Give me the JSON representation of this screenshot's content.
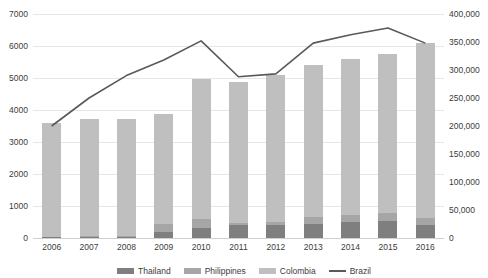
{
  "chart_data": {
    "type": "bar",
    "title": "",
    "subtitle": "",
    "xlabel": "",
    "ylabel": "",
    "grid": true,
    "legend_position": "bottom",
    "categories": [
      "2006",
      "2007",
      "2008",
      "2009",
      "2010",
      "2011",
      "2012",
      "2013",
      "2014",
      "2015",
      "2016"
    ],
    "series": [
      {
        "name": "Thailand",
        "axis": "left",
        "type": "bar",
        "color": "#7f7f7f",
        "values": [
          20,
          45,
          40,
          180,
          300,
          420,
          420,
          450,
          500,
          520,
          420
        ]
      },
      {
        "name": "Philippines",
        "axis": "left",
        "type": "bar",
        "color": "#a6a6a6",
        "values": [
          15,
          20,
          20,
          250,
          290,
          60,
          70,
          200,
          220,
          260,
          200
        ]
      },
      {
        "name": "Colombia",
        "axis": "left",
        "type": "bar",
        "color": "#bfbfbf",
        "values": [
          3565,
          3660,
          3665,
          3445,
          4390,
          4400,
          4610,
          4760,
          4880,
          4970,
          5480
        ]
      },
      {
        "name": "Brazil",
        "axis": "right",
        "type": "line",
        "color": "#595959",
        "values": [
          200000,
          250000,
          290000,
          318000,
          352000,
          288000,
          293000,
          348000,
          363000,
          375000,
          348000
        ]
      }
    ],
    "totals_left": [
      3600,
      3725,
      3725,
      3875,
      4980,
      4880,
      5100,
      5410,
      5600,
      5750,
      6100
    ],
    "left_axis": {
      "min": 0,
      "max": 7000,
      "step": 1000,
      "ticks": [
        "0",
        "1000",
        "2000",
        "3000",
        "4000",
        "5000",
        "6000",
        "7000"
      ]
    },
    "right_axis": {
      "min": 0,
      "max": 400000,
      "step": 50000,
      "ticks": [
        "0",
        "50,000",
        "100,000",
        "150,000",
        "200,000",
        "250,000",
        "300,000",
        "350,000",
        "400,000"
      ]
    }
  },
  "legend": {
    "items": [
      {
        "label": "Thailand",
        "marker": "square-swatch-dark"
      },
      {
        "label": "Philippines",
        "marker": "square-swatch-medium"
      },
      {
        "label": "Colombia",
        "marker": "square-swatch-light"
      },
      {
        "label": "Brazil",
        "marker": "line-swatch"
      }
    ]
  },
  "colors": {
    "thailand": "#7f7f7f",
    "philippines": "#a6a6a6",
    "colombia": "#bfbfbf",
    "brazil": "#595959",
    "gridline": "#e6e6e6",
    "text": "#3c3c3c"
  }
}
